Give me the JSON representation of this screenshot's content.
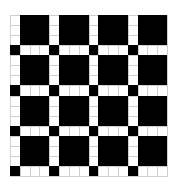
{
  "diagram": {
    "type": "grid-pattern",
    "rows": 16,
    "cols": 16,
    "block_size": 4,
    "colors": {
      "filled": "#000000",
      "empty": "#ffffff",
      "gridline": "#cfcfcf"
    },
    "block_pattern": [
      [
        0,
        1,
        1,
        1
      ],
      [
        0,
        1,
        1,
        1
      ],
      [
        0,
        1,
        1,
        1
      ],
      [
        1,
        0,
        0,
        0
      ]
    ]
  }
}
